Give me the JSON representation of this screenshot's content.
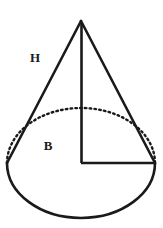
{
  "figure": {
    "name": "cone-geometry-diagram",
    "type": "geometric-solid-illustration",
    "solid": "cone",
    "background_color": "#ffffff",
    "stroke_color": "#1a1a1a",
    "canvas": {
      "width": 163,
      "height": 228
    }
  },
  "labels": {
    "slant_height": "H",
    "base": "B"
  },
  "label_positions": {
    "slant_height": {
      "x": 35,
      "y": 59
    },
    "base": {
      "x": 48,
      "y": 147
    }
  },
  "geometry": {
    "apex": {
      "x": 81,
      "y": 21
    },
    "base_center": {
      "x": 81,
      "y": 163
    },
    "base_rx": 74,
    "base_ry": 55,
    "left_base_point": {
      "x": 7,
      "y": 163
    },
    "right_base_point": {
      "x": 155,
      "y": 163
    },
    "ellipse_bottom": {
      "x": 81,
      "y": 218
    },
    "ellipse_top_hidden": {
      "x": 81,
      "y": 108
    }
  },
  "strokes": {
    "outline_width": 2.6,
    "axis_width": 2.6,
    "radius_width": 2.6,
    "dash_pattern": "1.6 3.2",
    "dash_width": 2.4
  },
  "parts": [
    {
      "name": "apex-vertex",
      "description": "top point of the cone"
    },
    {
      "name": "left-slant-edge",
      "description": "left slant side from apex to base left"
    },
    {
      "name": "right-slant-edge",
      "description": "right slant side from apex to base right"
    },
    {
      "name": "base-ellipse-front",
      "description": "solid visible lower half of base ellipse"
    },
    {
      "name": "base-ellipse-back",
      "description": "dotted hidden upper half of base ellipse"
    },
    {
      "name": "height-axis",
      "description": "vertical line from apex to base center"
    },
    {
      "name": "base-radius",
      "description": "horizontal line from base center to base right edge"
    }
  ]
}
